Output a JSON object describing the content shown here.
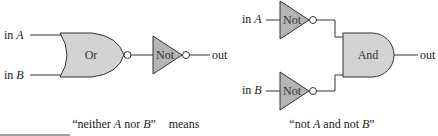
{
  "left_circuit": {
    "inputs": [
      "in A",
      "in B"
    ],
    "input_vars": [
      "A",
      "B"
    ],
    "gates": [
      {
        "type": "or",
        "label": "Or",
        "inverted_output": true
      },
      {
        "type": "not",
        "label": "Not"
      }
    ],
    "output": "out"
  },
  "right_circuit": {
    "inputs": [
      "in A",
      "in B"
    ],
    "input_vars": [
      "A",
      "B"
    ],
    "gates": [
      {
        "type": "not",
        "label": "Not"
      },
      {
        "type": "not",
        "label": "Not"
      },
      {
        "type": "and",
        "label": "And"
      }
    ],
    "output": "out"
  },
  "caption": {
    "left": {
      "pre": "“neither ",
      "a": "A",
      "mid": " nor ",
      "b": "B",
      "post": "”"
    },
    "connector": "means",
    "right": {
      "pre": "“not ",
      "a": "A",
      "mid": " and not ",
      "b": "B",
      "post": "”"
    }
  },
  "colors": {
    "or_and_fill": "#d3d3d3",
    "not_fill": "#b5b5b5",
    "stroke": "#333333"
  }
}
